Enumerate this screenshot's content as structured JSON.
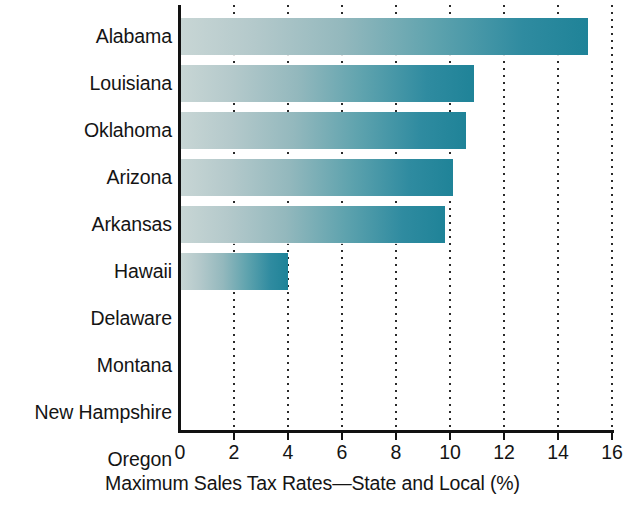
{
  "chart_data": {
    "type": "bar",
    "orientation": "horizontal",
    "title": "",
    "xlabel": "Maximum Sales Tax Rates—State and Local (%)",
    "ylabel": "",
    "categories": [
      "Alabama",
      "Louisiana",
      "Oklahoma",
      "Arizona",
      "Arkansas",
      "Hawaii",
      "Delaware",
      "Montana",
      "New Hampshire",
      "Oregon"
    ],
    "values": [
      15.1,
      10.9,
      10.6,
      10.1,
      9.8,
      4.0,
      0,
      0,
      0,
      0
    ],
    "xlim": [
      0,
      16
    ],
    "xticks": [
      0,
      2,
      4,
      6,
      8,
      10,
      12,
      14,
      16
    ],
    "xtick_labels": [
      "0",
      "2",
      "4",
      "6",
      "8",
      "10",
      "12",
      "14",
      "16"
    ],
    "grid": "vertical-dotted",
    "legend": "none",
    "bar_gradient_start": "#c8d6d5",
    "bar_gradient_end": "#1f8398",
    "axis_color": "#121212",
    "text_color": "#141414",
    "background": "#ffffff"
  },
  "caption": {
    "text": "Maximum Sales Tax Rates—State and Local (%)"
  }
}
